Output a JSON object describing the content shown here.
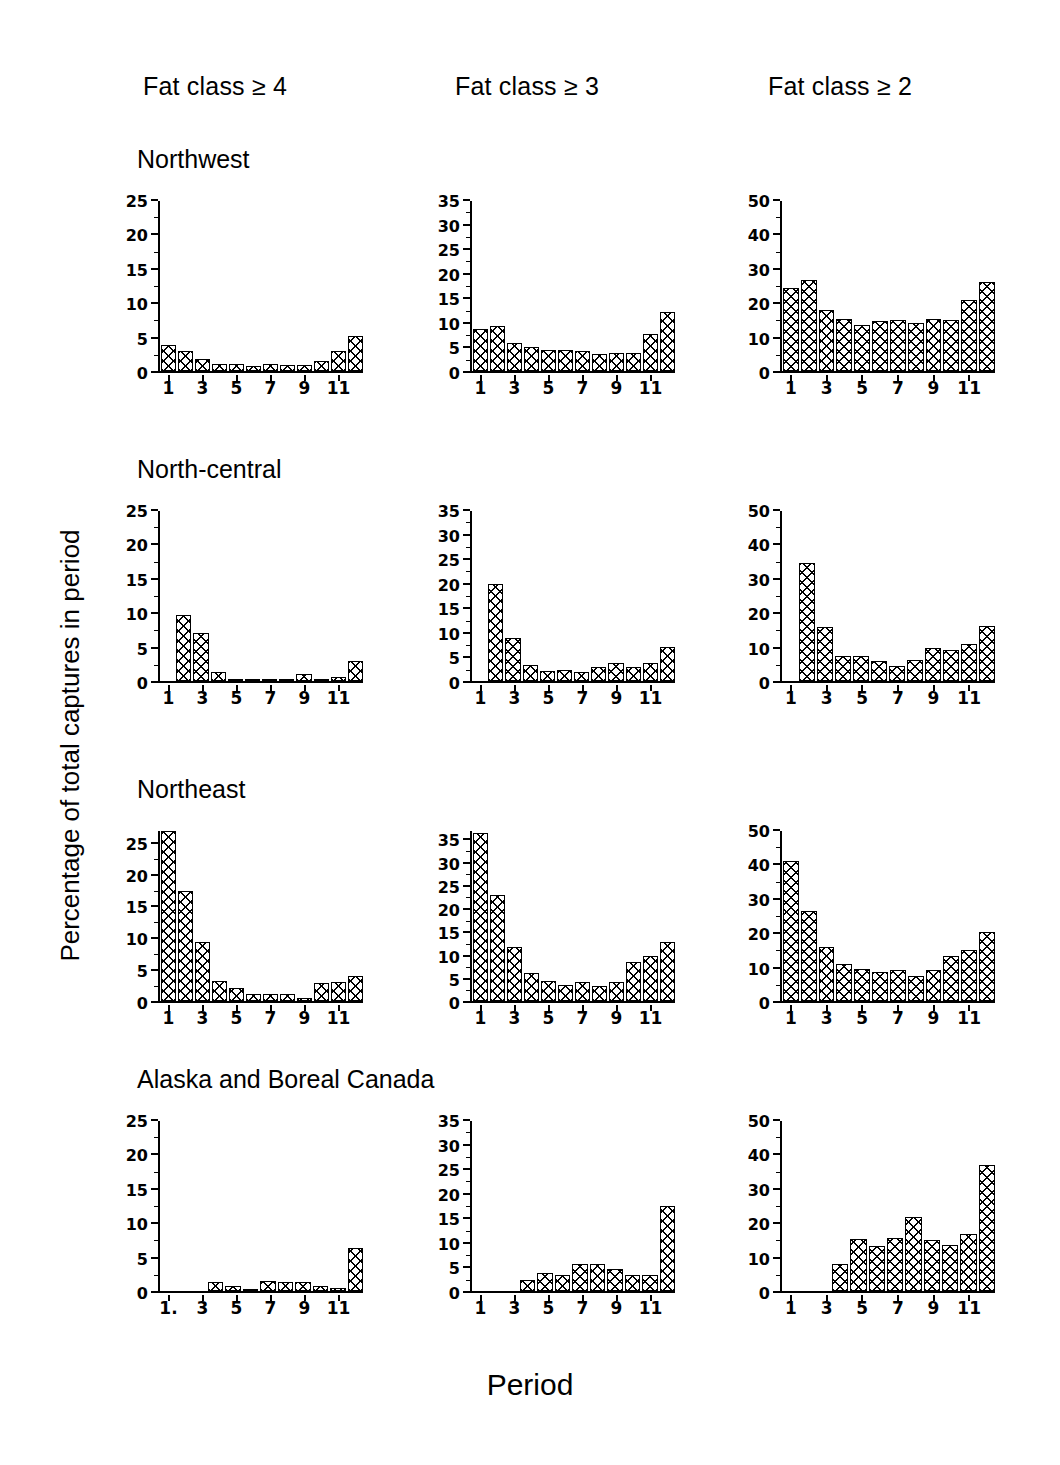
{
  "figure": {
    "ylabel": "Percentage of total captures in period",
    "xlabel": "Period"
  },
  "columns": [
    {
      "header": "Fat class ≥ 4"
    },
    {
      "header": "Fat class ≥ 3"
    },
    {
      "header": "Fat class ≥ 2"
    }
  ],
  "regions": [
    {
      "title": "Northwest"
    },
    {
      "title": "North-central"
    },
    {
      "title": "Northeast"
    },
    {
      "title": "Alaska and Boreal Canada"
    }
  ],
  "chart_data": [
    {
      "type": "bar",
      "title": "Northwest — Fat class ≥ 4",
      "region": "Northwest",
      "fat_class": "Fat class ≥ 4",
      "xlabel": "Period",
      "ylabel": "Percentage of total captures in period",
      "categories": [
        "1",
        "2",
        "3",
        "4",
        "5",
        "6",
        "7",
        "8",
        "9",
        "10",
        "11",
        "12"
      ],
      "tick_labels": [
        "1",
        "",
        "3",
        "",
        "5",
        "",
        "7",
        "",
        "9",
        "",
        "11",
        ""
      ],
      "values": [
        3.8,
        3.0,
        1.8,
        1.0,
        1.0,
        0.8,
        1.0,
        0.9,
        0.9,
        1.4,
        2.9,
        5.2
      ],
      "ylim": [
        0,
        25
      ],
      "yticks": [
        0,
        5,
        10,
        15,
        20,
        25
      ],
      "grid": false,
      "legend": "none"
    },
    {
      "type": "bar",
      "title": "Northwest — Fat class ≥ 3",
      "region": "Northwest",
      "fat_class": "Fat class ≥ 3",
      "xlabel": "Period",
      "ylabel": "Percentage of total captures in period",
      "categories": [
        "1",
        "2",
        "3",
        "4",
        "5",
        "6",
        "7",
        "8",
        "9",
        "10",
        "11",
        "12"
      ],
      "tick_labels": [
        "1",
        "",
        "3",
        "",
        "5",
        "",
        "7",
        "",
        "9",
        "",
        "11",
        ""
      ],
      "values": [
        8.7,
        9.3,
        5.8,
        4.9,
        4.4,
        4.4,
        4.2,
        3.6,
        3.7,
        3.8,
        7.6,
        12.1
      ],
      "ylim": [
        0,
        35
      ],
      "yticks": [
        0,
        5,
        10,
        15,
        20,
        25,
        30,
        35
      ],
      "grid": false,
      "legend": "none"
    },
    {
      "type": "bar",
      "title": "Northwest — Fat class ≥ 2",
      "region": "Northwest",
      "fat_class": "Fat class ≥ 2",
      "xlabel": "Period",
      "ylabel": "Percentage of total captures in period",
      "categories": [
        "1",
        "2",
        "3",
        "4",
        "5",
        "6",
        "7",
        "8",
        "9",
        "10",
        "11",
        "12"
      ],
      "tick_labels": [
        "1",
        "",
        "3",
        "",
        "5",
        "",
        "7",
        "",
        "9",
        "",
        "11",
        ""
      ],
      "values": [
        24.5,
        26.8,
        17.8,
        15.3,
        13.5,
        14.8,
        15.1,
        14.2,
        15.3,
        15.1,
        20.8,
        26.2
      ],
      "ylim": [
        0,
        50
      ],
      "yticks": [
        0,
        10,
        20,
        30,
        40,
        50
      ],
      "grid": false,
      "legend": "none"
    },
    {
      "type": "bar",
      "title": "North-central — Fat class ≥ 4",
      "region": "North-central",
      "fat_class": "Fat class ≥ 4",
      "xlabel": "Period",
      "ylabel": "Percentage of total captures in period",
      "categories": [
        "1",
        "2",
        "3",
        "4",
        "5",
        "6",
        "7",
        "8",
        "9",
        "10",
        "11",
        "12"
      ],
      "tick_labels": [
        "1",
        "",
        "3",
        "",
        "5",
        "",
        "7",
        "",
        "9",
        "",
        "11",
        ""
      ],
      "values": [
        0.0,
        9.7,
        7.0,
        1.3,
        0.2,
        0.3,
        0.3,
        0.3,
        1.0,
        0.2,
        0.6,
        3.0
      ],
      "ylim": [
        0,
        25
      ],
      "yticks": [
        0,
        5,
        10,
        15,
        20,
        25
      ],
      "grid": false,
      "legend": "none"
    },
    {
      "type": "bar",
      "title": "North-central — Fat class ≥ 3",
      "region": "North-central",
      "fat_class": "Fat class ≥ 3",
      "xlabel": "Period",
      "ylabel": "Percentage of total captures in period",
      "categories": [
        "1",
        "2",
        "3",
        "4",
        "5",
        "6",
        "7",
        "8",
        "9",
        "10",
        "11",
        "12"
      ],
      "tick_labels": [
        "1",
        "",
        "3",
        "",
        "5",
        "",
        "7",
        "",
        "9",
        "",
        "11",
        ""
      ],
      "values": [
        0.0,
        19.9,
        8.9,
        3.3,
        2.1,
        2.3,
        1.9,
        2.9,
        3.8,
        2.9,
        3.7,
        7.1
      ],
      "ylim": [
        0,
        35
      ],
      "yticks": [
        0,
        5,
        10,
        15,
        20,
        25,
        30,
        35
      ],
      "grid": false,
      "legend": "none"
    },
    {
      "type": "bar",
      "title": "North-central — Fat class ≥ 2",
      "region": "North-central",
      "fat_class": "Fat class ≥ 2",
      "xlabel": "Period",
      "ylabel": "Percentage of total captures in period",
      "categories": [
        "1",
        "2",
        "3",
        "4",
        "5",
        "6",
        "7",
        "8",
        "9",
        "10",
        "11",
        "12"
      ],
      "tick_labels": [
        "1",
        "",
        "3",
        "",
        "5",
        "",
        "7",
        "",
        "9",
        "",
        "11",
        ""
      ],
      "values": [
        0.0,
        34.8,
        15.9,
        7.4,
        7.5,
        5.9,
        4.4,
        6.1,
        9.8,
        9.1,
        10.9,
        16.2
      ],
      "ylim": [
        0,
        50
      ],
      "yticks": [
        0,
        10,
        20,
        30,
        40,
        50
      ],
      "grid": false,
      "legend": "none"
    },
    {
      "type": "bar",
      "title": "Northeast — Fat class ≥ 4",
      "region": "Northeast",
      "fat_class": "Fat class ≥ 4",
      "xlabel": "Period",
      "ylabel": "Percentage of total captures in period",
      "categories": [
        "1",
        "2",
        "3",
        "4",
        "5",
        "6",
        "7",
        "8",
        "9",
        "10",
        "11",
        "12"
      ],
      "tick_labels": [
        "1",
        "",
        "3",
        "",
        "5",
        "",
        "7",
        "",
        "9",
        "",
        "11",
        ""
      ],
      "values": [
        27.0,
        17.5,
        9.3,
        3.1,
        2.1,
        1.1,
        1.1,
        1.1,
        0.5,
        2.9,
        3.0,
        4.0
      ],
      "ylim": [
        0,
        27
      ],
      "yticks": [
        0,
        5,
        10,
        15,
        20,
        25
      ],
      "grid": false,
      "legend": "none"
    },
    {
      "type": "bar",
      "title": "Northeast — Fat class ≥ 3",
      "region": "Northeast",
      "fat_class": "Fat class ≥ 3",
      "xlabel": "Period",
      "ylabel": "Percentage of total captures in period",
      "categories": [
        "1",
        "2",
        "3",
        "4",
        "5",
        "6",
        "7",
        "8",
        "9",
        "10",
        "11",
        "12"
      ],
      "tick_labels": [
        "1",
        "",
        "3",
        "",
        "5",
        "",
        "7",
        "",
        "9",
        "",
        "11",
        ""
      ],
      "values": [
        36.5,
        23.0,
        11.8,
        6.2,
        4.3,
        3.4,
        4.1,
        3.3,
        4.1,
        8.5,
        9.8,
        12.9
      ],
      "ylim": [
        0,
        37
      ],
      "yticks": [
        0,
        5,
        10,
        15,
        20,
        25,
        30,
        35
      ],
      "grid": false,
      "legend": "none"
    },
    {
      "type": "bar",
      "title": "Northeast — Fat class ≥ 2",
      "region": "Northeast",
      "fat_class": "Fat class ≥ 2",
      "xlabel": "Period",
      "ylabel": "Percentage of total captures in period",
      "categories": [
        "1",
        "2",
        "3",
        "4",
        "5",
        "6",
        "7",
        "8",
        "9",
        "10",
        "11",
        "12"
      ],
      "tick_labels": [
        "1",
        "",
        "3",
        "",
        "5",
        "",
        "7",
        "",
        "9",
        "",
        "11",
        ""
      ],
      "values": [
        41.2,
        26.5,
        16.0,
        11.0,
        9.5,
        8.6,
        9.1,
        7.4,
        9.0,
        13.1,
        15.1,
        20.3
      ],
      "ylim": [
        0,
        50
      ],
      "yticks": [
        0,
        10,
        20,
        30,
        40,
        50
      ],
      "grid": false,
      "legend": "none"
    },
    {
      "type": "bar",
      "title": "Alaska and Boreal Canada — Fat class ≥ 4",
      "region": "Alaska and Boreal Canada",
      "fat_class": "Fat class ≥ 4",
      "xlabel": "Period",
      "ylabel": "Percentage of total captures in period",
      "categories": [
        "1",
        "2",
        "3",
        "4",
        "5",
        "6",
        "7",
        "8",
        "9",
        "10",
        "11",
        "12"
      ],
      "tick_labels": [
        "1.",
        "",
        "3",
        "",
        "5",
        "",
        "7",
        "",
        "9",
        "",
        "11",
        ""
      ],
      "values": [
        0.0,
        0.0,
        0.0,
        1.3,
        0.8,
        0.3,
        1.4,
        1.3,
        1.3,
        0.8,
        0.4,
        6.3
      ],
      "ylim": [
        0,
        25
      ],
      "yticks": [
        0,
        5,
        10,
        15,
        20,
        25
      ],
      "grid": false,
      "legend": "none"
    },
    {
      "type": "bar",
      "title": "Alaska and Boreal Canada — Fat class ≥ 3",
      "region": "Alaska and Boreal Canada",
      "fat_class": "Fat class ≥ 3",
      "xlabel": "Period",
      "ylabel": "Percentage of total captures in period",
      "categories": [
        "1",
        "2",
        "3",
        "4",
        "5",
        "6",
        "7",
        "8",
        "9",
        "10",
        "11",
        "12"
      ],
      "tick_labels": [
        "1",
        "",
        "3",
        "",
        "5",
        "",
        "7",
        "",
        "9",
        "",
        "11",
        ""
      ],
      "values": [
        0.0,
        0.0,
        0.0,
        2.2,
        3.7,
        3.2,
        5.6,
        5.5,
        4.6,
        3.3,
        3.2,
        17.5
      ],
      "ylim": [
        0,
        35
      ],
      "yticks": [
        0,
        5,
        10,
        15,
        20,
        25,
        30,
        35
      ],
      "grid": false,
      "legend": "none"
    },
    {
      "type": "bar",
      "title": "Alaska and Boreal Canada — Fat class ≥ 2",
      "region": "Alaska and Boreal Canada",
      "fat_class": "Fat class ≥ 2",
      "xlabel": "Period",
      "ylabel": "Percentage of total captures in period",
      "categories": [
        "1",
        "2",
        "3",
        "4",
        "5",
        "6",
        "7",
        "8",
        "9",
        "10",
        "11",
        "12"
      ],
      "tick_labels": [
        "1",
        "",
        "3",
        "",
        "5",
        "",
        "7",
        "",
        "9",
        "",
        "11",
        ""
      ],
      "values": [
        0.0,
        0.0,
        0.0,
        8.0,
        15.3,
        13.3,
        15.5,
        21.9,
        15.1,
        13.6,
        16.8,
        37.0
      ],
      "ylim": [
        0,
        50
      ],
      "yticks": [
        0,
        10,
        20,
        30,
        40,
        50
      ],
      "grid": false,
      "legend": "none"
    }
  ]
}
